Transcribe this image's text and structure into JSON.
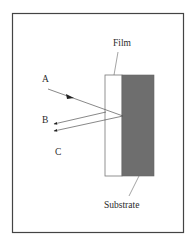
{
  "labels": {
    "film": "Film",
    "substrate": "Substrate",
    "ray_a": "A",
    "ray_b": "B",
    "ray_c": "C"
  },
  "colors": {
    "frame": "#444444",
    "substrate_fill": "#6e6e6e",
    "film_fill": "#ffffff",
    "line": "#555555"
  }
}
